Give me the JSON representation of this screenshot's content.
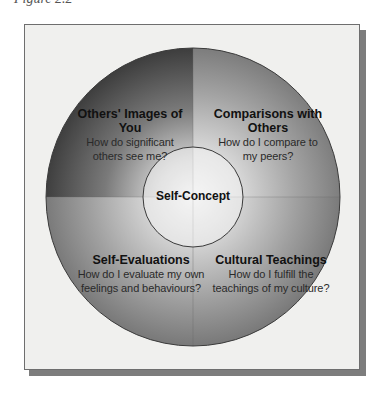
{
  "figure": {
    "caption_fragment": "Figure 2.2",
    "center": {
      "label": "Self-Concept"
    },
    "quadrants": [
      {
        "position": "top-left",
        "title": "Others' Images of You",
        "question_line1": "How do significant",
        "question_line2": "others see me?",
        "color": "#4e4e4e"
      },
      {
        "position": "top-right",
        "title_line1": "Comparisons with",
        "title_line2": "Others",
        "question_line1": "How do I compare to",
        "question_line2": "my peers?",
        "color": "#8f8f8f"
      },
      {
        "position": "bottom-left",
        "title": "Self-Evaluations",
        "question_line1": "How do I evaluate my own",
        "question_line2": "feelings and behaviours?",
        "color": "#8c8c8c"
      },
      {
        "position": "bottom-right",
        "title": "Cultural Teachings",
        "question_line1": "How do I fulfill the",
        "question_line2": "teachings of my culture?",
        "color": "#8e8e8e"
      }
    ],
    "colors": {
      "frame_background": "#f0f0ee",
      "frame_border": "#6e6e6e",
      "shadow": "#7d7d7d",
      "outline": "#3a3a3a",
      "center_glow": "#f4f4f4"
    }
  }
}
